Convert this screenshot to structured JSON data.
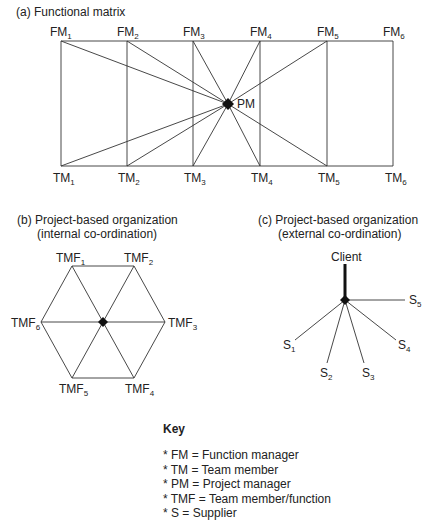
{
  "panel_a": {
    "title": "(a)  Functional matrix",
    "top_nodes": [
      {
        "base": "FM",
        "sub": "1"
      },
      {
        "base": "FM",
        "sub": "2"
      },
      {
        "base": "FM",
        "sub": "3"
      },
      {
        "base": "FM",
        "sub": "4"
      },
      {
        "base": "FM",
        "sub": "5"
      },
      {
        "base": "FM",
        "sub": "6"
      }
    ],
    "bottom_nodes": [
      {
        "base": "TM",
        "sub": "1"
      },
      {
        "base": "TM",
        "sub": "2"
      },
      {
        "base": "TM",
        "sub": "3"
      },
      {
        "base": "TM",
        "sub": "4"
      },
      {
        "base": "TM",
        "sub": "5"
      },
      {
        "base": "TM",
        "sub": "6"
      }
    ],
    "center_node": "PM"
  },
  "panel_b": {
    "title_line1": "(b)  Project-based organization",
    "title_line2": "(internal co-ordination)",
    "nodes": [
      {
        "base": "TMF",
        "sub": "1"
      },
      {
        "base": "TMF",
        "sub": "2"
      },
      {
        "base": "TMF",
        "sub": "3"
      },
      {
        "base": "TMF",
        "sub": "4"
      },
      {
        "base": "TMF",
        "sub": "5"
      },
      {
        "base": "TMF",
        "sub": "6"
      }
    ]
  },
  "panel_c": {
    "title_line1": "(c)  Project-based organization",
    "title_line2": "(external co-ordination)",
    "hub": "Client",
    "nodes": [
      {
        "base": "S",
        "sub": "1"
      },
      {
        "base": "S",
        "sub": "2"
      },
      {
        "base": "S",
        "sub": "3"
      },
      {
        "base": "S",
        "sub": "4"
      },
      {
        "base": "S",
        "sub": "5"
      }
    ]
  },
  "key": {
    "title": "Key",
    "items": [
      "* FM = Function manager",
      "* TM = Team member",
      "* PM = Project manager",
      "* TMF = Team member/function",
      "* S = Supplier"
    ]
  }
}
